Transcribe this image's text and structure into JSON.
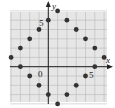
{
  "figure": {
    "x_axis_label": "x",
    "y_axis_label": "y",
    "origin_label": "0",
    "x_tick_label": "5",
    "y_tick_label": "5"
  },
  "colors": {
    "grid": "#b8b8b8",
    "grid_bg": "#e6e6e6",
    "axis": "#222222",
    "point": "#333333"
  },
  "grid": {
    "x_min": -4,
    "x_max": 6,
    "y_min": -4,
    "y_max": 6
  },
  "points": [
    [
      1,
      6
    ],
    [
      0,
      5
    ],
    [
      2,
      5
    ],
    [
      -1,
      4
    ],
    [
      3,
      4
    ],
    [
      -2,
      3
    ],
    [
      4,
      3
    ],
    [
      -3,
      2
    ],
    [
      5,
      2
    ],
    [
      -4,
      1
    ],
    [
      6,
      1
    ],
    [
      -3,
      0
    ],
    [
      5,
      0
    ],
    [
      -2,
      -1
    ],
    [
      4,
      -1
    ],
    [
      -1,
      -2
    ],
    [
      3,
      -2
    ],
    [
      0,
      -3
    ],
    [
      2,
      -3
    ],
    [
      1,
      -4
    ]
  ]
}
